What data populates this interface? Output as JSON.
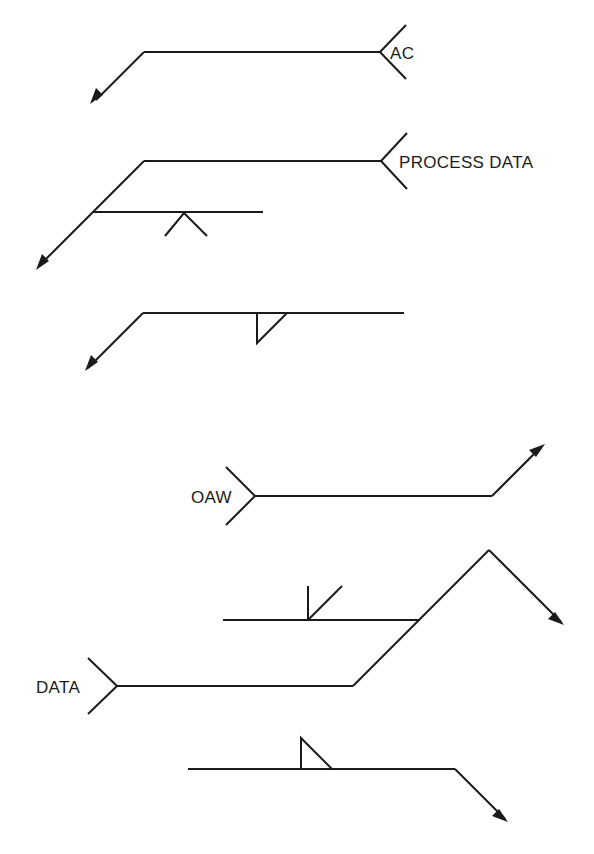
{
  "diagram": {
    "title": "",
    "labels": {
      "ac": "AC",
      "process_data": "PROCESS DATA",
      "oaw": "OAW",
      "data": "DATA"
    },
    "symbols": [
      {
        "id": "ac",
        "type": "leader-with-tail",
        "label": "AC",
        "description": "Reference line with arrow leader down-left; tail opens right containing 'AC'"
      },
      {
        "id": "process-data",
        "type": "leader-with-tail-and-branch",
        "label": "PROCESS DATA",
        "description": "Reference line with tail 'PROCESS DATA'; a second reference line branches from the arrow leader carrying an inverted V symbol below"
      },
      {
        "id": "fillet-arrow-side",
        "type": "reference-line-with-symbol",
        "label": "",
        "description": "Reference line with arrow leader down-left; fillet (triangle) weld symbol below line"
      },
      {
        "id": "oaw",
        "type": "leader-with-tail",
        "label": "OAW",
        "description": "Reference line with tail on left containing 'OAW'; arrow leader up-right"
      },
      {
        "id": "data",
        "type": "multi-reference",
        "label": "DATA",
        "description": "Tail 'DATA' on left; lower reference line jogs up-right to a second reference line carrying a bevel symbol above; arrow leader goes down-right"
      },
      {
        "id": "fillet-other-side",
        "type": "reference-line-with-symbol",
        "label": "",
        "description": "Reference line with fillet (triangle) symbol above; arrow leader down-right"
      }
    ]
  }
}
